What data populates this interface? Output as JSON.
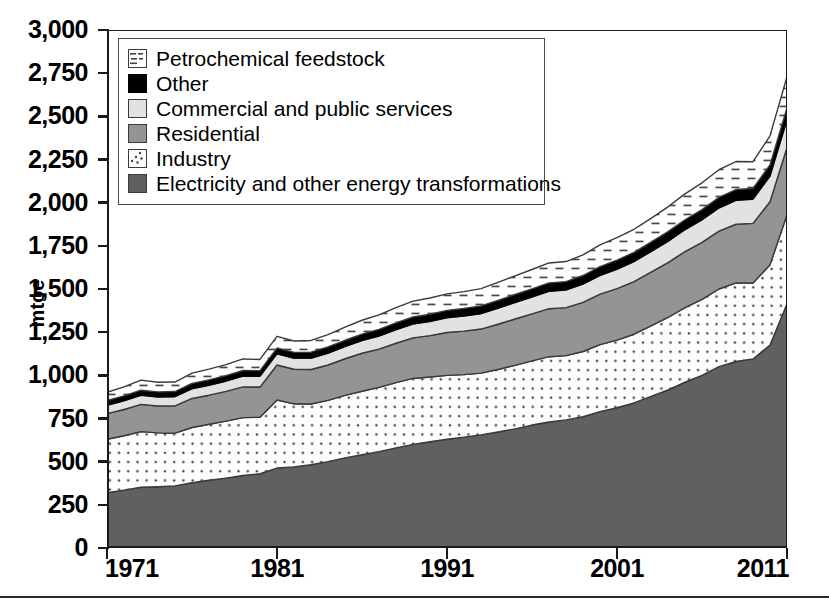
{
  "axes": {
    "y_title": "mtoe",
    "y_ticks": [
      "3,000",
      "2,750",
      "2,500",
      "2,250",
      "2,000",
      "1,750",
      "1,500",
      "1,250",
      "1,000",
      "750",
      "500",
      "250",
      "0"
    ],
    "y_min": 0,
    "y_max": 3000,
    "y_step": 250,
    "x_ticks": [
      "1971",
      "1981",
      "1991",
      "2001",
      "2011"
    ],
    "x_min": 1971,
    "x_max": 2011
  },
  "legend": {
    "items": [
      {
        "label": "Petrochemical feedstock",
        "swatch": "petrochemical-feedstock-swatch",
        "fill": "#ffffff",
        "pattern": "dashes"
      },
      {
        "label": "Other",
        "swatch": "other-swatch",
        "fill": "#000000",
        "pattern": "solid"
      },
      {
        "label": "Commercial and public services",
        "swatch": "commercial-and-public-services-swatch",
        "fill": "#e2e2e2",
        "pattern": "solid"
      },
      {
        "label": "Residential",
        "swatch": "residential-swatch",
        "fill": "#949494",
        "pattern": "solid"
      },
      {
        "label": "Industry",
        "swatch": "industry-swatch",
        "fill": "#fdfdfd",
        "pattern": "diagonal-dots"
      },
      {
        "label": "Electricity and other energy transformations",
        "swatch": "electricity-and-other-energy-transformations-swatch",
        "fill": "#606060",
        "pattern": "solid"
      }
    ]
  },
  "chart_data": {
    "type": "area",
    "stacked": true,
    "title": "",
    "xlabel": "",
    "ylabel": "mtoe",
    "xlim": [
      1971,
      2011
    ],
    "ylim": [
      0,
      3000
    ],
    "grid": false,
    "legend_position": "top-left",
    "x": [
      1971,
      1972,
      1973,
      1974,
      1975,
      1976,
      1977,
      1978,
      1979,
      1980,
      1981,
      1982,
      1983,
      1984,
      1985,
      1986,
      1987,
      1988,
      1989,
      1990,
      1991,
      1992,
      1993,
      1994,
      1995,
      1996,
      1997,
      1998,
      1999,
      2000,
      2001,
      2002,
      2003,
      2004,
      2005,
      2006,
      2007,
      2008,
      2009,
      2010,
      2011
    ],
    "series": [
      {
        "name": "Electricity and other energy transformations",
        "fill": "#606060",
        "values": [
          320,
          335,
          352,
          355,
          360,
          378,
          392,
          405,
          420,
          430,
          463,
          470,
          482,
          500,
          522,
          540,
          558,
          580,
          600,
          615,
          630,
          642,
          655,
          672,
          690,
          712,
          730,
          742,
          760,
          790,
          812,
          840,
          878,
          915,
          960,
          1000,
          1050,
          1080,
          1095,
          1175,
          1415
        ]
      },
      {
        "name": "Industry",
        "fill": "#fdfdfd",
        "values": [
          310,
          315,
          322,
          312,
          305,
          320,
          325,
          330,
          335,
          327,
          394,
          365,
          352,
          355,
          362,
          368,
          372,
          378,
          382,
          375,
          370,
          362,
          358,
          362,
          368,
          372,
          378,
          372,
          378,
          388,
          392,
          398,
          408,
          420,
          432,
          440,
          450,
          455,
          440,
          465,
          515
        ]
      },
      {
        "name": "Residential",
        "fill": "#949494",
        "values": [
          148,
          152,
          158,
          155,
          158,
          168,
          168,
          172,
          178,
          175,
          203,
          200,
          200,
          205,
          212,
          220,
          222,
          228,
          235,
          240,
          248,
          252,
          255,
          262,
          268,
          272,
          278,
          278,
          285,
          292,
          298,
          305,
          312,
          318,
          325,
          330,
          335,
          340,
          345,
          365,
          390
        ]
      },
      {
        "name": "Commercial and public services",
        "fill": "#e2e2e2",
        "values": [
          48,
          50,
          52,
          52,
          53,
          56,
          57,
          59,
          62,
          62,
          64,
          64,
          65,
          68,
          70,
          73,
          75,
          78,
          80,
          82,
          85,
          87,
          89,
          92,
          95,
          97,
          100,
          102,
          105,
          108,
          112,
          115,
          118,
          122,
          126,
          130,
          134,
          138,
          140,
          148,
          158
        ]
      },
      {
        "name": "Other",
        "fill": "#000000",
        "values": [
          28,
          29,
          30,
          30,
          30,
          31,
          32,
          32,
          33,
          33,
          34,
          34,
          35,
          36,
          37,
          38,
          39,
          40,
          41,
          42,
          43,
          44,
          45,
          46,
          47,
          48,
          49,
          49,
          50,
          52,
          53,
          54,
          55,
          57,
          58,
          60,
          62,
          63,
          62,
          66,
          70
        ]
      },
      {
        "name": "Petrochemical feedstock",
        "fill": "#ffffff",
        "values": [
          48,
          52,
          58,
          56,
          55,
          60,
          62,
          64,
          67,
          65,
          68,
          66,
          68,
          72,
          76,
          80,
          84,
          88,
          92,
          94,
          96,
          98,
          100,
          104,
          108,
          112,
          116,
          116,
          120,
          126,
          130,
          134,
          138,
          144,
          150,
          155,
          160,
          162,
          155,
          168,
          182
        ]
      }
    ],
    "totals": [
      902,
      933,
      972,
      960,
      961,
      1013,
      1036,
      1062,
      1095,
      1092,
      1226,
      1199,
      1202,
      1236,
      1279,
      1319,
      1350,
      1392,
      1430,
      1448,
      1472,
      1485,
      1502,
      1538,
      1576,
      1613,
      1651,
      1659,
      1698,
      1756,
      1797,
      1846,
      1909,
      1976,
      2051,
      2115,
      2191,
      2238,
      2237,
      2387,
      2730
    ]
  }
}
